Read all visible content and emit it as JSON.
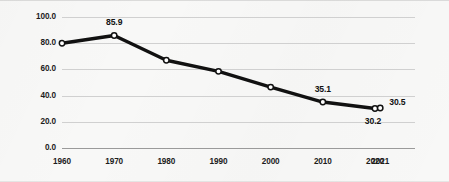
{
  "chart_data": {
    "type": "line",
    "title": "",
    "subtitle": "",
    "xlabel": "",
    "ylabel": "",
    "grid": true,
    "legend": false,
    "legend_position": "none",
    "categories": [
      "1960",
      "1970",
      "1980",
      "1990",
      "2000",
      "2010",
      "2020",
      "2021"
    ],
    "x": [
      1960,
      1970,
      1980,
      1990,
      2000,
      2010,
      2020,
      2021
    ],
    "values": [
      80.0,
      85.9,
      67.0,
      58.5,
      46.5,
      35.1,
      30.2,
      30.5
    ],
    "point_labels": [
      "",
      "85.9",
      "",
      "",
      "",
      "35.1",
      "30.2",
      "30.5"
    ],
    "series": [
      {
        "name": "",
        "values": [
          80.0,
          85.9,
          67.0,
          58.5,
          46.5,
          35.1,
          30.2,
          30.5
        ]
      }
    ],
    "ylim": [
      0.0,
      100.0
    ],
    "ytick_step": 20.0,
    "ytick_labels": [
      "100.0",
      "80.0",
      "60.0",
      "40.0",
      "20.0",
      "0.0"
    ],
    "ytick_values": [
      100.0,
      80.0,
      60.0,
      40.0,
      20.0,
      0.0
    ],
    "xtick_labels": [
      "1960",
      "1970",
      "1980",
      "1990",
      "2000",
      "2010",
      "2020",
      "2021"
    ],
    "line_color": "#111111",
    "marker_fill": "#ffffff",
    "marker_edge": "#111111",
    "gridline_color": "#d0d0d0",
    "axis_color": "#9a9a9a",
    "background_color": "#f8f8f7"
  },
  "annotations": {
    "peak": "85.9",
    "y2010": "35.1",
    "y2020": "30.2",
    "y2021": "30.5"
  }
}
